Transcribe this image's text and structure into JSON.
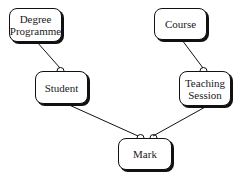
{
  "diagram": {
    "type": "entity-relationship",
    "entities": [
      {
        "id": "degree_programme",
        "label_line1": "Degree",
        "label_line2": "Programme"
      },
      {
        "id": "course",
        "label_line1": "Course",
        "label_line2": ""
      },
      {
        "id": "student",
        "label_line1": "Student",
        "label_line2": ""
      },
      {
        "id": "teaching_session",
        "label_line1": "Teaching",
        "label_line2": "Session"
      },
      {
        "id": "mark",
        "label_line1": "Mark",
        "label_line2": ""
      }
    ],
    "relationships": [
      {
        "from": "Degree Programme",
        "to": "Student",
        "cardinality": "one-to-many"
      },
      {
        "from": "Course",
        "to": "Teaching Session",
        "cardinality": "one-to-many"
      },
      {
        "from": "Student",
        "to": "Mark",
        "cardinality": "one-to-many"
      },
      {
        "from": "Teaching Session",
        "to": "Mark",
        "cardinality": "one-to-many"
      }
    ],
    "colors": {
      "line": "#111111",
      "box_fill": "#ffffff",
      "text": "#1a1a1a"
    }
  }
}
